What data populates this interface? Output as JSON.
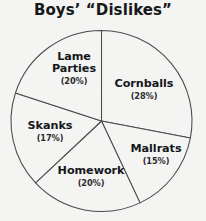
{
  "figure": {
    "title": "Boys’ “Dislikes”",
    "background_color": "#f4f4f3",
    "outline_color": "#4b4b4b",
    "text_color": "#15181a"
  },
  "chart_data": {
    "type": "pie",
    "title": "Boys’ “Dislikes”",
    "categories": [
      "Cornballs",
      "Mallrats",
      "Homework",
      "Skanks",
      "Lame Parties"
    ],
    "values": [
      28,
      15,
      20,
      17,
      20
    ],
    "value_unit": "%",
    "start_angle_deg": 90,
    "direction": "clockwise",
    "legend": "none",
    "labels_position": "inside-slices",
    "slice_fill": "#f4f4f3",
    "slice_stroke": "#4b4b4b",
    "slices": [
      {
        "name": "Cornballs",
        "value": 28,
        "label": "Cornballs",
        "percent_text": "(28%)",
        "name_line1": "Cornballs",
        "name_line2": ""
      },
      {
        "name": "Mallrats",
        "value": 15,
        "label": "Mallrats",
        "percent_text": "(15%)",
        "name_line1": "Mallrats",
        "name_line2": ""
      },
      {
        "name": "Homework",
        "value": 20,
        "label": "Homework",
        "percent_text": "(20%)",
        "name_line1": "Homework",
        "name_line2": ""
      },
      {
        "name": "Skanks",
        "value": 17,
        "label": "Skanks",
        "percent_text": "(17%)",
        "name_line1": "Skanks",
        "name_line2": ""
      },
      {
        "name": "Lame Parties",
        "value": 20,
        "label": "Lame Parties",
        "percent_text": "(20%)",
        "name_line1": "Lame",
        "name_line2": "Parties"
      }
    ]
  }
}
